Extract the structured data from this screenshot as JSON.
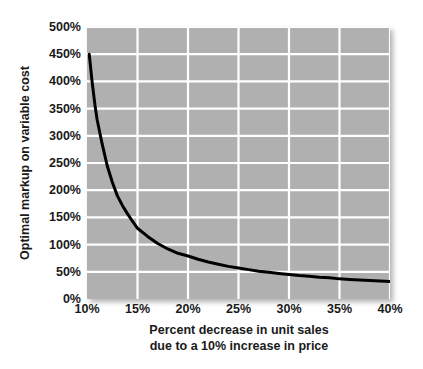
{
  "chart_data": {
    "type": "line",
    "title": "",
    "xlabel": "Percent decrease in unit sales due to a 10% increase in price",
    "xlabel_line1": "Percent decrease in unit sales",
    "xlabel_line2": "due to a 10% increase in price",
    "ylabel": "Optimal markup on variable cost",
    "xlim": [
      10,
      40
    ],
    "ylim": [
      0,
      500
    ],
    "xticks": [
      10,
      15,
      20,
      25,
      30,
      35,
      40
    ],
    "xticklabels": [
      "10%",
      "15%",
      "20%",
      "25%",
      "30%",
      "35%",
      "40%"
    ],
    "yticks": [
      0,
      50,
      100,
      150,
      200,
      250,
      300,
      350,
      400,
      450,
      500
    ],
    "yticklabels": [
      "0%",
      "50%",
      "100%",
      "150%",
      "200%",
      "250%",
      "300%",
      "350%",
      "400%",
      "450%",
      "500%"
    ],
    "grid": true,
    "grid_color": "#ffffff",
    "plot_bgcolor": "#b0b0b0",
    "line_color": "#000000",
    "line_width": 3,
    "legend": null,
    "series": [
      {
        "name": "Optimal markup",
        "x": [
          10.22,
          10.5,
          10.8,
          11.0,
          11.5,
          12.0,
          12.5,
          13.0,
          13.5,
          14.0,
          14.5,
          15.0,
          16.0,
          17.0,
          18.0,
          19.0,
          20.0,
          21.0,
          22.0,
          23.0,
          24.0,
          25.0,
          26.0,
          27.0,
          28.0,
          29.0,
          30.0,
          31.0,
          32.0,
          33.0,
          34.0,
          35.0,
          36.0,
          37.0,
          38.0,
          39.0,
          40.0
        ],
        "y": [
          450,
          400,
          355,
          330,
          285,
          245,
          215,
          190,
          172,
          157,
          143,
          130,
          115,
          102,
          92,
          84,
          79,
          73,
          68,
          64,
          60,
          57,
          54,
          51,
          49,
          47,
          45,
          43,
          42,
          40,
          39,
          37,
          36,
          35,
          34,
          33,
          32
        ]
      }
    ]
  }
}
